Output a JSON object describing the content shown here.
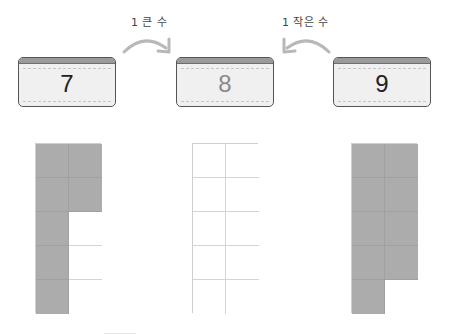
{
  "labels": {
    "one_more": "1 큰 수",
    "one_less": "1 작은 수"
  },
  "cards": [
    {
      "value": "7",
      "role": "given-smaller"
    },
    {
      "value": "8",
      "role": "target"
    },
    {
      "value": "9",
      "role": "given-larger"
    }
  ],
  "grids": [
    {
      "number": 7,
      "rows": 5,
      "cols": 2,
      "cells": [
        1,
        1,
        1,
        1,
        1,
        0,
        1,
        0,
        1,
        0
      ]
    },
    {
      "number": 8,
      "rows": 5,
      "cols": 2,
      "cells": [
        0,
        0,
        0,
        0,
        0,
        0,
        0,
        0,
        0,
        0
      ]
    },
    {
      "number": 9,
      "rows": 5,
      "cols": 2,
      "cells": [
        1,
        1,
        1,
        1,
        1,
        1,
        1,
        1,
        1,
        0
      ]
    }
  ],
  "colors": {
    "filled": "#acacac",
    "empty": "#ffffff",
    "card_bg": "#f0f0f0",
    "arrow": "#b8b8b8"
  },
  "icons": {
    "arrow_right": "curved-arrow-right-icon",
    "arrow_left": "curved-arrow-left-icon"
  }
}
